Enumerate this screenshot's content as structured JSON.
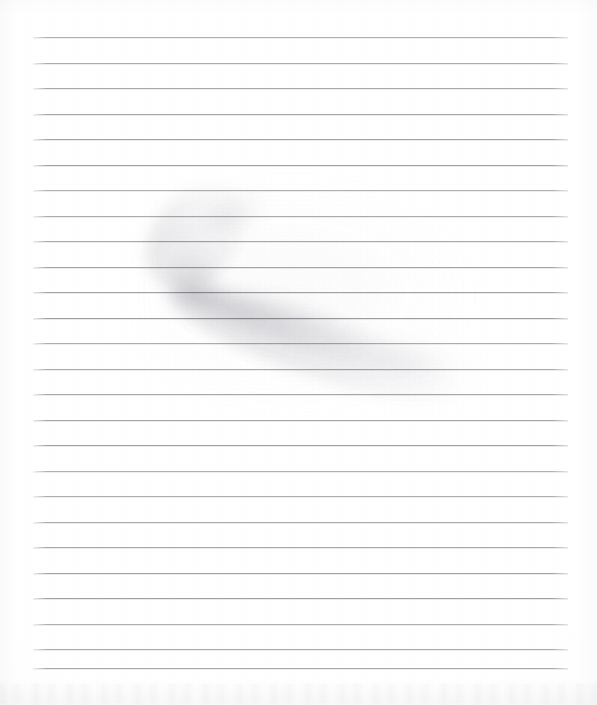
{
  "document": {
    "type": "scanned-lined-paper",
    "title": "Blank Ruled Notebook Page",
    "text_content": "",
    "width": 597,
    "height": 705,
    "background_color": "#ffffff",
    "paper_tone": "#fdfdfd"
  },
  "ruling": {
    "line_color": "#9b9b9f",
    "line_thickness_px": 1,
    "line_left_px": 33,
    "line_right_px": 568,
    "first_line_y_px": 37,
    "line_spacing_px": 25.5,
    "line_count": 26,
    "margin_line_present": false,
    "lines_y": [
      37,
      62.5,
      88,
      113.5,
      139,
      164.5,
      190,
      215.5,
      241,
      266.5,
      292,
      317.5,
      343,
      368.5,
      394,
      419.5,
      445,
      470.5,
      496,
      521.5,
      547,
      572.5,
      598,
      623.5,
      649,
      668
    ]
  },
  "marks": {
    "primary_smudge": {
      "name": "boomerang-smudge",
      "description": "faint grey boomerang / chevron shaped shadow or eraser smudge",
      "color": "#b4b4bc",
      "opacity": 0.28,
      "vertex_px": [
        172,
        288
      ],
      "upper_arm_end_px": [
        262,
        196
      ],
      "lower_arm_end_px": [
        466,
        392
      ],
      "bounding_box_px": [
        155,
        188,
        330,
        212
      ]
    },
    "bottom_band": {
      "name": "scan-edge-band",
      "description": "faint mottled grey band along the bottom edge of the scan",
      "color": "#d6d6da",
      "opacity": 0.12,
      "y_px": 683,
      "height_px": 22
    }
  }
}
